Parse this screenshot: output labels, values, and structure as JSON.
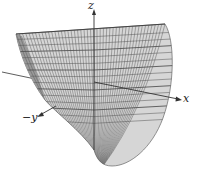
{
  "figure": {
    "type": "3d-surface",
    "axes": {
      "z_label": "z",
      "x_label": "x",
      "neg_y_label": "−y"
    },
    "colors": {
      "mesh_fill": "#cfcfcf",
      "mesh_line": "#555555",
      "mesh_dark": "#8a8a8a",
      "axis": "#333333",
      "background": "#ffffff"
    },
    "mesh": {
      "vertical_lines": 46,
      "horizontal_lines": 14
    }
  }
}
